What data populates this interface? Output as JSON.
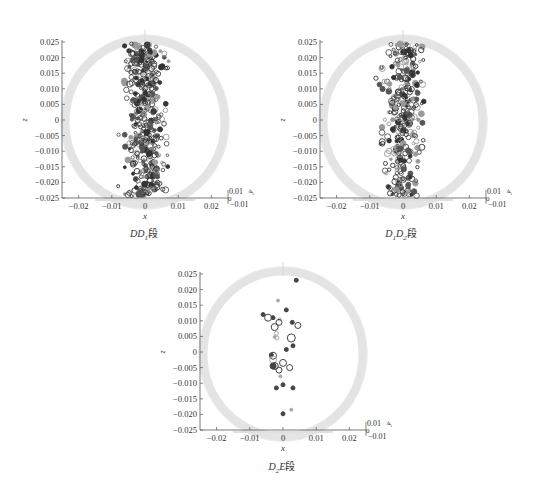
{
  "chart_data": [
    {
      "type": "scatter",
      "title": "",
      "caption": "DD1段",
      "caption_main": "DD",
      "caption_sub": "1",
      "caption_suffix": "段",
      "xlabel": "x",
      "ylabel": "z",
      "zlabel": "y",
      "xlim": [
        -0.025,
        0.025
      ],
      "ylim": [
        -0.025,
        0.025
      ],
      "xticks": [
        "-0.02",
        "-0.01",
        "0",
        "0.01",
        "0.02"
      ],
      "yticks": [
        "0.025",
        "0.020",
        "0.015",
        "0.010",
        "0.005",
        "0",
        "-0.005",
        "-0.010",
        "-0.015",
        "-0.020",
        "-0.025"
      ],
      "zticks": [
        "0.01",
        "0",
        "-0.01"
      ],
      "grid": false,
      "description": "Dense vertical band of circular markers around x≈0 (spread about -0.006..0.006) spanning z from -0.025 to 0.025 inside a light grey cylinder outline",
      "density": 420,
      "x_spread": 0.0045,
      "seed": 11
    },
    {
      "type": "scatter",
      "title": "",
      "caption": "D1D2段",
      "caption_main": "D",
      "caption_sub": "1",
      "caption_main2": "D",
      "caption_sub2": "2",
      "caption_suffix": "段",
      "xlabel": "x",
      "ylabel": "z",
      "zlabel": "y",
      "xlim": [
        -0.025,
        0.025
      ],
      "ylim": [
        -0.025,
        0.025
      ],
      "xticks": [
        "-0.02",
        "-0.01",
        "0",
        "0.01",
        "0.02"
      ],
      "yticks": [
        "0.025",
        "0.020",
        "0.015",
        "0.010",
        "0.005",
        "0",
        "-0.005",
        "-0.010",
        "-0.015",
        "-0.020",
        "-0.025"
      ],
      "zticks": [
        "0.01",
        "0",
        "-0.01"
      ],
      "grid": false,
      "description": "Vertical band of circular markers around x≈0 (spread about -0.007..0.007) spanning z from -0.023 to 0.024",
      "density": 330,
      "x_spread": 0.0045,
      "seed": 29
    },
    {
      "type": "scatter",
      "title": "",
      "caption": "D2E段",
      "caption_main": "D",
      "caption_sub": "2",
      "caption_main2": "E",
      "caption_suffix": "段",
      "xlabel": "x",
      "ylabel": "z",
      "zlabel": "y",
      "xlim": [
        -0.025,
        0.025
      ],
      "ylim": [
        -0.025,
        0.025
      ],
      "xticks": [
        "-0.02",
        "-0.01",
        "0",
        "0.01",
        "0.02"
      ],
      "yticks": [
        "0.025",
        "0.020",
        "0.015",
        "0.010",
        "0.005",
        "0",
        "-0.005",
        "-0.010",
        "-0.015",
        "-0.020",
        "-0.025"
      ],
      "zticks": [
        "0.01",
        "0",
        "-0.01"
      ],
      "grid": false,
      "points": [
        {
          "x": 0.004,
          "z": 0.023,
          "r": 2,
          "fill": true
        },
        {
          "x": -0.0015,
          "z": 0.0165,
          "r": 1.5,
          "fill": true,
          "light": true
        },
        {
          "x": 0.001,
          "z": 0.0135,
          "r": 2,
          "fill": true
        },
        {
          "x": -0.006,
          "z": 0.012,
          "r": 2,
          "fill": true
        },
        {
          "x": -0.0045,
          "z": 0.011,
          "r": 3.5,
          "fill": false
        },
        {
          "x": -0.003,
          "z": 0.011,
          "r": 2,
          "fill": true
        },
        {
          "x": -0.001,
          "z": 0.0105,
          "r": 1.5,
          "fill": false,
          "light": true
        },
        {
          "x": -0.0012,
          "z": 0.0095,
          "r": 3,
          "fill": false
        },
        {
          "x": 0.0028,
          "z": 0.0095,
          "r": 2,
          "fill": true
        },
        {
          "x": 0.0045,
          "z": 0.0085,
          "r": 3,
          "fill": false
        },
        {
          "x": -0.0025,
          "z": 0.008,
          "r": 3.5,
          "fill": false
        },
        {
          "x": -0.002,
          "z": 0.006,
          "r": 2,
          "fill": false,
          "light": true
        },
        {
          "x": -0.0025,
          "z": 0.0048,
          "r": 1.5,
          "fill": true,
          "light": true
        },
        {
          "x": -0.0018,
          "z": 0.0045,
          "r": 2,
          "fill": false,
          "light": true
        },
        {
          "x": 0.0025,
          "z": 0.0045,
          "r": 4,
          "fill": false
        },
        {
          "x": 0.003,
          "z": 0.002,
          "r": 2,
          "fill": true
        },
        {
          "x": 0.001,
          "z": 0.0008,
          "r": 2,
          "fill": true
        },
        {
          "x": -0.0035,
          "z": -0.001,
          "r": 2,
          "fill": true
        },
        {
          "x": -0.003,
          "z": -0.0012,
          "r": 3.5,
          "fill": false
        },
        {
          "x": -0.003,
          "z": -0.0025,
          "r": 3.5,
          "fill": false,
          "light": true
        },
        {
          "x": 0.0,
          "z": -0.0035,
          "r": 3.5,
          "fill": false
        },
        {
          "x": -0.003,
          "z": -0.0045,
          "r": 3,
          "fill": true
        },
        {
          "x": -0.0025,
          "z": -0.0045,
          "r": 3.5,
          "fill": false
        },
        {
          "x": 0.002,
          "z": -0.005,
          "r": 3,
          "fill": false
        },
        {
          "x": -0.0012,
          "z": -0.0058,
          "r": 3,
          "fill": false
        },
        {
          "x": -0.0008,
          "z": -0.0078,
          "r": 1.5,
          "fill": true,
          "light": true
        },
        {
          "x": 0.0,
          "z": -0.0105,
          "r": 2,
          "fill": true
        },
        {
          "x": -0.002,
          "z": -0.0115,
          "r": 2,
          "fill": true
        },
        {
          "x": 0.003,
          "z": -0.0115,
          "r": 2,
          "fill": true
        },
        {
          "x": 0.0025,
          "z": -0.0185,
          "r": 1.5,
          "fill": true,
          "light": true
        },
        {
          "x": 0.0,
          "z": -0.0198,
          "r": 2,
          "fill": true
        }
      ]
    }
  ]
}
